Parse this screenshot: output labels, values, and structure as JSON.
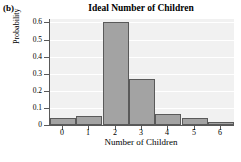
{
  "figure": {
    "panel_label": "(b)",
    "background_color": "#ffffff"
  },
  "chart_data": {
    "type": "bar",
    "title": "Ideal Number of Children",
    "xlabel": "Number of Children",
    "ylabel": "Probability",
    "categories": [
      "0",
      "1",
      "2",
      "3",
      "4",
      "5",
      "6"
    ],
    "values": [
      0.04,
      0.05,
      0.6,
      0.27,
      0.065,
      0.04,
      0.02
    ],
    "ylim": [
      0,
      0.62
    ],
    "ytick_labels": [
      "0",
      "0.1",
      "0.2",
      "0.3",
      "0.4",
      "0.5",
      "0.6"
    ],
    "ytick_values": [
      0,
      0.1,
      0.2,
      0.3,
      0.4,
      0.5,
      0.6
    ],
    "grid": true,
    "legend": "none",
    "bar_fill_color": "#a3a3a3",
    "bar_edge_color": "#5a5a5a",
    "plot_background_color": "#f1f1f1",
    "gridline_color": "#ffffff",
    "axis_color": "#595959"
  }
}
